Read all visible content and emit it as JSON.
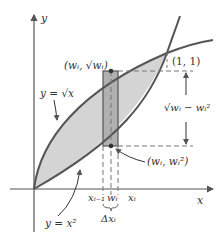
{
  "diagram": {
    "axes": {
      "x_label": "x",
      "y_label": "y"
    },
    "curves": {
      "upper": {
        "label": "y = √x",
        "equation": "y = sqrt(x)"
      },
      "lower": {
        "label": "y = x²",
        "equation": "y = x^2"
      }
    },
    "points": {
      "intersection": "(1, 1)",
      "top_point": "(wᵢ, √wᵢ)",
      "bottom_point": "(wᵢ, wᵢ²)"
    },
    "height_label": "√wᵢ − wᵢ²",
    "x_ticks": {
      "left": "xᵢ₋₁",
      "mid": "wᵢ",
      "right": "xᵢ"
    },
    "width_label": "Δxᵢ",
    "colors": {
      "region_fill": "#d4d4d4",
      "rect_fill": "#b0b0b0",
      "curve": "#555555",
      "axis": "#555555",
      "text": "#333333"
    }
  }
}
